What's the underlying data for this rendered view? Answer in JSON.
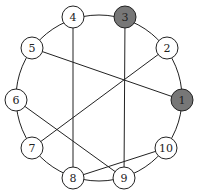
{
  "diagram": {
    "type": "circular-graph",
    "ring_center": [
      99,
      98
    ],
    "ring_radius": 83,
    "node_radius": 11,
    "colors": {
      "default_fill": "#ffffff",
      "highlight_fill": "#777777",
      "stroke": "#222222"
    },
    "nodes": [
      {
        "id": "1",
        "label": "1",
        "x": 182,
        "y": 100,
        "highlighted": true
      },
      {
        "id": "2",
        "label": "2",
        "x": 167,
        "y": 48,
        "highlighted": false
      },
      {
        "id": "3",
        "label": "3",
        "x": 125,
        "y": 17,
        "highlighted": true
      },
      {
        "id": "4",
        "label": "4",
        "x": 73,
        "y": 17,
        "highlighted": false
      },
      {
        "id": "5",
        "label": "5",
        "x": 32,
        "y": 48,
        "highlighted": false
      },
      {
        "id": "6",
        "label": "6",
        "x": 16,
        "y": 100,
        "highlighted": false
      },
      {
        "id": "7",
        "label": "7",
        "x": 32,
        "y": 148,
        "highlighted": false
      },
      {
        "id": "8",
        "label": "8",
        "x": 73,
        "y": 178,
        "highlighted": false
      },
      {
        "id": "9",
        "label": "9",
        "x": 124,
        "y": 178,
        "highlighted": false
      },
      {
        "id": "10",
        "label": "10",
        "x": 166,
        "y": 148,
        "highlighted": false
      }
    ],
    "ring_edges": [
      [
        "1",
        "2"
      ],
      [
        "2",
        "3"
      ],
      [
        "3",
        "4"
      ],
      [
        "4",
        "5"
      ],
      [
        "5",
        "6"
      ],
      [
        "6",
        "7"
      ],
      [
        "7",
        "8"
      ],
      [
        "8",
        "9"
      ],
      [
        "9",
        "10"
      ],
      [
        "10",
        "1"
      ]
    ],
    "chords": [
      [
        "5",
        "1"
      ],
      [
        "2",
        "7"
      ],
      [
        "4",
        "8"
      ],
      [
        "3",
        "9"
      ],
      [
        "6",
        "9"
      ],
      [
        "8",
        "10"
      ]
    ]
  }
}
